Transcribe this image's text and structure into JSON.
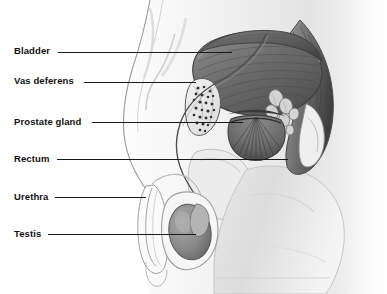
{
  "figure": {
    "background_color": "#ffffff",
    "label_color": "#111111",
    "leader_line_color": "#1a1a1a",
    "illustration_style": "grayscale anatomical engraving"
  },
  "labels": [
    {
      "id": "bladder",
      "text": "Bladder",
      "x": 14,
      "y": 46,
      "leader": {
        "x1": 58,
        "y1": 52,
        "x2": 232,
        "y2": 52
      }
    },
    {
      "id": "vas-deferens",
      "text": "Vas deferens",
      "x": 14,
      "y": 76,
      "leader": {
        "x1": 84,
        "y1": 82,
        "x2": 196,
        "y2": 82
      }
    },
    {
      "id": "prostate-gland",
      "text": "Prostate gland",
      "x": 14,
      "y": 117,
      "leader": {
        "x1": 92,
        "y1": 122,
        "x2": 243,
        "y2": 122
      }
    },
    {
      "id": "rectum",
      "text": "Rectum",
      "x": 14,
      "y": 154,
      "leader": {
        "x1": 57,
        "y1": 159,
        "x2": 288,
        "y2": 159
      }
    },
    {
      "id": "urethra",
      "text": "Urethra",
      "x": 14,
      "y": 192,
      "leader": {
        "x1": 55,
        "y1": 197,
        "x2": 146,
        "y2": 197
      }
    },
    {
      "id": "testis",
      "text": "Testis",
      "x": 14,
      "y": 229,
      "leader": {
        "x1": 48,
        "y1": 234,
        "x2": 196,
        "y2": 234
      }
    }
  ],
  "structures": [
    {
      "id": "bladder",
      "name": "Bladder"
    },
    {
      "id": "vas-deferens",
      "name": "Vas deferens"
    },
    {
      "id": "prostate-gland",
      "name": "Prostate gland"
    },
    {
      "id": "rectum",
      "name": "Rectum"
    },
    {
      "id": "urethra",
      "name": "Urethra"
    },
    {
      "id": "testis",
      "name": "Testis"
    },
    {
      "id": "seminal-vesicle",
      "name": "Seminal vesicle"
    },
    {
      "id": "epididymis",
      "name": "Epididymis"
    },
    {
      "id": "scrotum",
      "name": "Scrotum"
    },
    {
      "id": "penis",
      "name": "Penis"
    },
    {
      "id": "body-outline",
      "name": "Body outline"
    }
  ]
}
